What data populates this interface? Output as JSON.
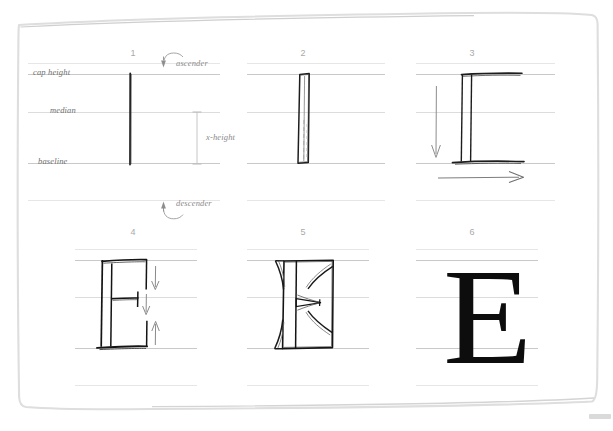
{
  "sheet": {
    "title": "Serif capital E construction sheet",
    "background_color": "#ffffff",
    "frame_color": "#dcdcdc",
    "rule_color": "#dcdcdc",
    "glyph_color": "#0d0d0d",
    "label_color": "#6f6f6f",
    "number_color": "#a9a9a9"
  },
  "guides": {
    "labels": [
      {
        "name": "cap-height",
        "text": "cap height"
      },
      {
        "name": "median",
        "text": "median"
      },
      {
        "name": "baseline",
        "text": "baseline"
      }
    ],
    "annotations": [
      {
        "name": "ascender",
        "text": "ascender"
      },
      {
        "name": "x-height",
        "text": "x-height"
      },
      {
        "name": "descender",
        "text": "descender"
      }
    ]
  },
  "panels": [
    {
      "number": "1",
      "caption": "stem",
      "glyph": ""
    },
    {
      "number": "2",
      "caption": "tapered stem",
      "glyph": ""
    },
    {
      "number": "3",
      "caption": "serifs",
      "glyph": ""
    },
    {
      "number": "4",
      "caption": "arms",
      "glyph": ""
    },
    {
      "number": "5",
      "caption": "bracketed serifs",
      "glyph": ""
    },
    {
      "number": "6",
      "caption": "finished letter",
      "glyph": "E"
    }
  ]
}
